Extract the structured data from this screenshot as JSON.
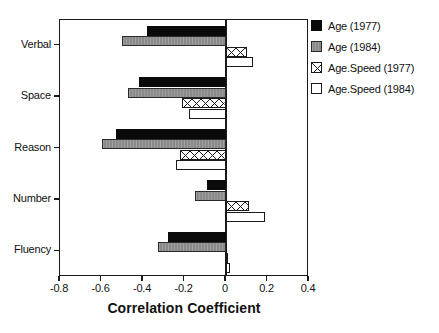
{
  "chart_data": {
    "type": "bar",
    "orientation": "horizontal",
    "title": "",
    "xlabel": "Correlation Coefficient",
    "ylabel": "",
    "xlim": [
      -0.8,
      0.4
    ],
    "xticks": [
      "-0.8",
      "-0.6",
      "-0.4",
      "-0.2",
      "0",
      "0.2",
      "0.4"
    ],
    "xtick_values": [
      -0.8,
      -0.6,
      -0.4,
      -0.2,
      0,
      0.2,
      0.4
    ],
    "grid": false,
    "legend_position": "right",
    "categories": [
      "Verbal",
      "Space",
      "Reason",
      "Number",
      "Fluency"
    ],
    "series": [
      {
        "name": "Age (1977)",
        "style": "black",
        "color": "#0a0a0a",
        "values": [
          -0.38,
          -0.42,
          -0.53,
          -0.09,
          -0.28
        ]
      },
      {
        "name": "Age (1984)",
        "style": "gray",
        "color": "#8a8a8a",
        "values": [
          -0.5,
          -0.47,
          -0.6,
          -0.15,
          -0.33
        ]
      },
      {
        "name": "Age.Speed (1977)",
        "style": "hatch",
        "color": "#ffffff",
        "values": [
          0.1,
          -0.21,
          -0.22,
          0.11,
          0.01
        ]
      },
      {
        "name": "Age.Speed (1984)",
        "style": "white",
        "color": "#ffffff",
        "values": [
          0.13,
          -0.18,
          -0.24,
          0.19,
          0.02
        ]
      }
    ]
  },
  "legend": {
    "items": [
      {
        "label": "Age (1977)"
      },
      {
        "label": "Age (1984)"
      },
      {
        "label": "Age.Speed (1977)"
      },
      {
        "label": "Age.Speed (1984)"
      }
    ]
  }
}
